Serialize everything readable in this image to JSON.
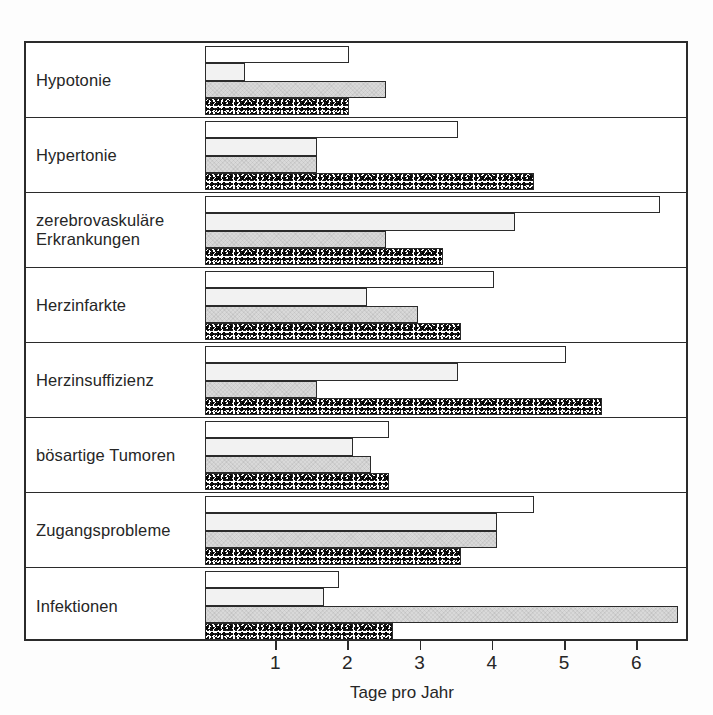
{
  "chart_data": {
    "type": "bar",
    "orientation": "horizontal",
    "title": "",
    "xlabel": "Tage pro Jahr",
    "ylabel": "",
    "xlim": [
      0,
      6.9
    ],
    "xticks": [
      1,
      2,
      3,
      4,
      5,
      6
    ],
    "xtick_labels": [
      "1",
      "2",
      "3",
      "4",
      "5",
      "6"
    ],
    "grid": false,
    "legend": null,
    "categories": [
      "Hypotonie",
      "Hypertonie",
      "zerebrovaskuläre\nErkrankungen",
      "Herzinfarkte",
      "Herzinsuffizienz",
      "bösartige Tumoren",
      "Zugangsprobleme",
      "Infektionen"
    ],
    "series": [
      {
        "name": "series-1",
        "fill": "white",
        "values": [
          2.0,
          3.5,
          6.3,
          4.0,
          5.0,
          2.55,
          4.55,
          1.85
        ]
      },
      {
        "name": "series-2",
        "fill": "light",
        "values": [
          0.55,
          1.55,
          4.3,
          2.25,
          3.5,
          2.05,
          4.05,
          1.65
        ]
      },
      {
        "name": "series-3",
        "fill": "gray",
        "values": [
          2.5,
          1.55,
          2.5,
          2.95,
          1.55,
          2.3,
          4.05,
          6.55
        ]
      },
      {
        "name": "series-4",
        "fill": "speckled",
        "values": [
          2.0,
          4.55,
          3.3,
          3.55,
          5.5,
          2.55,
          3.55,
          2.6
        ]
      }
    ]
  },
  "axis": {
    "title": "Tage pro Jahr"
  },
  "colors": {
    "frame": "#2b2b2b",
    "series_1": "#ffffff",
    "series_2": "#f2f2f2",
    "series_3": "#d9d9d9",
    "series_4": "#8a8a8a"
  }
}
